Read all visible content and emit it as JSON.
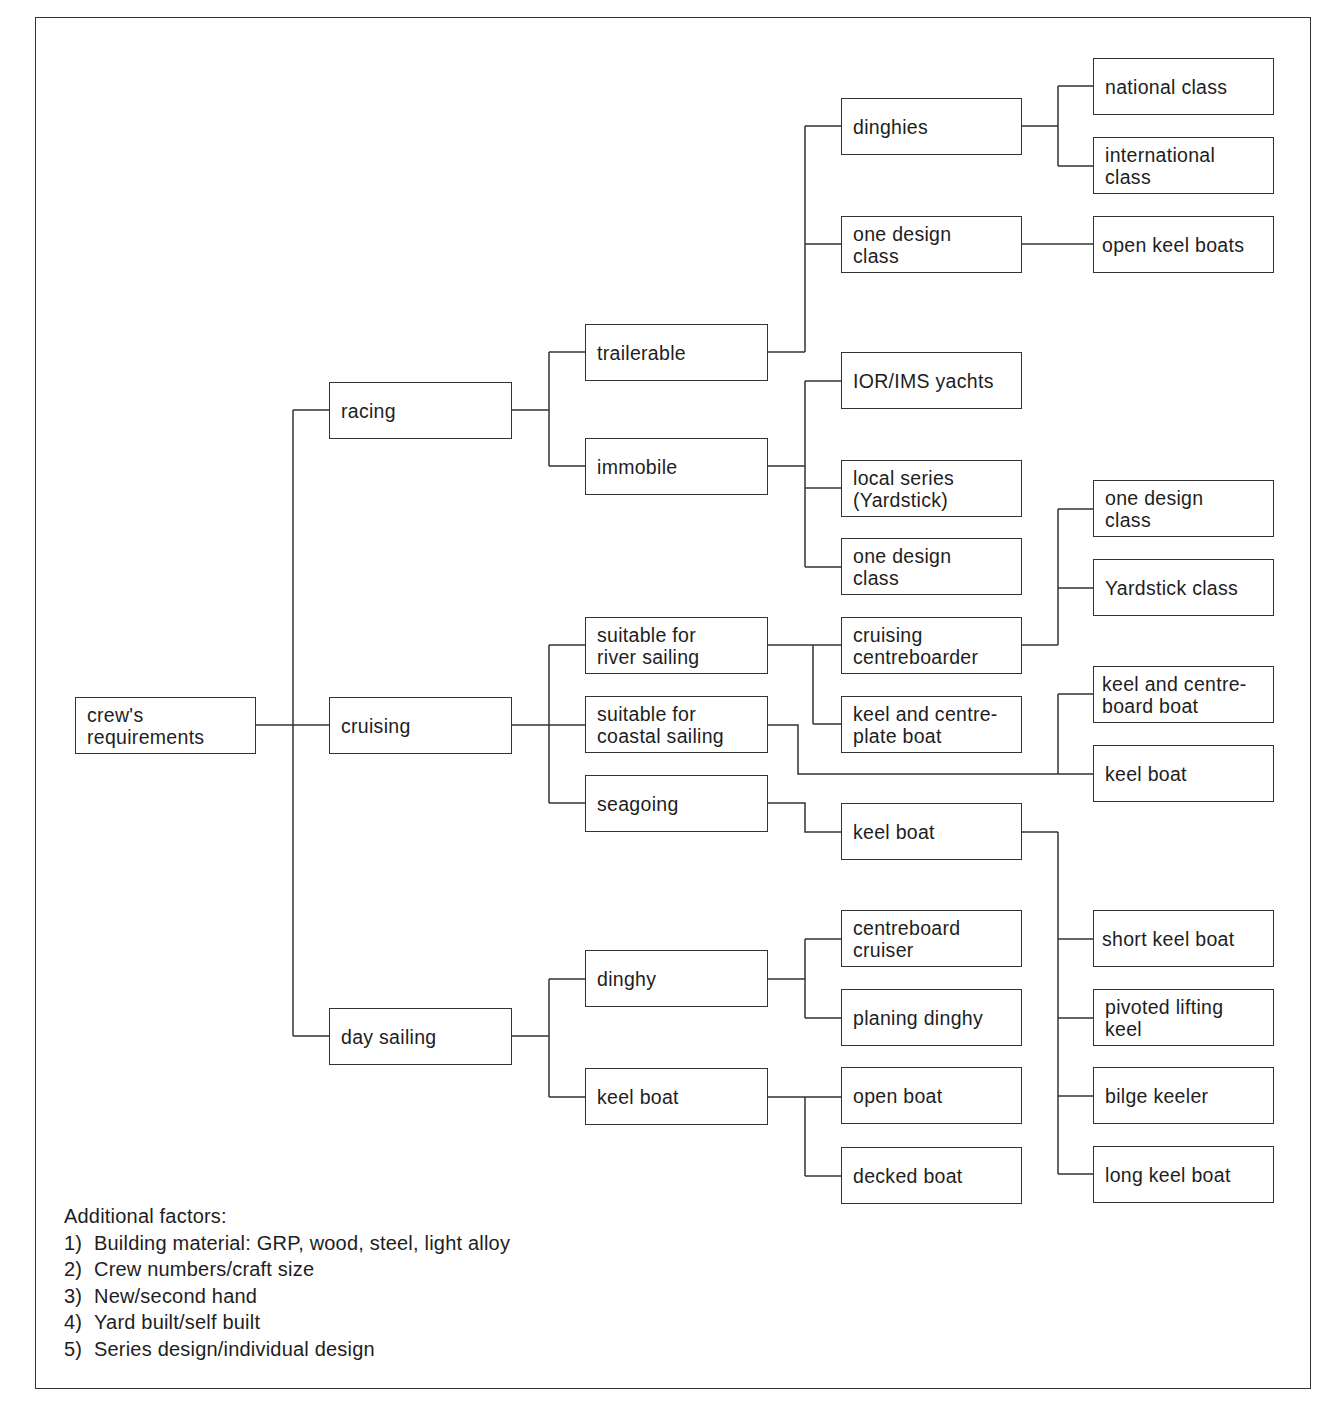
{
  "diagram": {
    "root": "crew's\nrequirements",
    "level1": {
      "racing": "racing",
      "cruising": "cruising",
      "day_sailing": "day sailing"
    },
    "racing": {
      "trailerable": "trailerable",
      "immobile": "immobile",
      "dinghies": "dinghies",
      "one_design_class": "one design\nclass",
      "national_class": "national class",
      "international_class": "international\nclass",
      "open_keel_boats": "open keel boats",
      "ior_ims": "IOR/IMS yachts",
      "local_series": "local series\n(Yardstick)",
      "one_design_class_2": "one design\nclass"
    },
    "cruising": {
      "river": "suitable for\nriver sailing",
      "coastal": "suitable for\ncoastal sailing",
      "seagoing": "seagoing",
      "cruising_centreboarder": "cruising\ncentreboarder",
      "keel_centreplate": "keel and centre-\nplate boat",
      "one_design_class": "one design\nclass",
      "yardstick_class": "Yardstick class",
      "keel_centreboard": "keel and centre-\nboard boat",
      "keel_boat_coastal": "keel boat",
      "keel_boat_seagoing": "keel boat",
      "short_keel": "short keel boat",
      "pivoted_lifting": "pivoted lifting\nkeel",
      "bilge_keeler": "bilge keeler",
      "long_keel": "long keel boat"
    },
    "day_sailing": {
      "dinghy": "dinghy",
      "keel_boat": "keel boat",
      "centreboard_cruiser": "centreboard\ncruiser",
      "planing_dinghy": "planing dinghy",
      "open_boat": "open boat",
      "decked_boat": "decked boat"
    }
  },
  "additional_factors": {
    "title": "Additional factors:",
    "items": [
      {
        "num": "1)",
        "text": "Building material: GRP, wood, steel, light alloy"
      },
      {
        "num": "2)",
        "text": "Crew numbers/craft size"
      },
      {
        "num": "3)",
        "text": "New/second hand"
      },
      {
        "num": "4)",
        "text": "Yard built/self built"
      },
      {
        "num": "5)",
        "text": "Series design/individual design"
      }
    ]
  },
  "colors": {
    "line": "#333333",
    "text": "#1e1e1e",
    "background": "#ffffff"
  }
}
